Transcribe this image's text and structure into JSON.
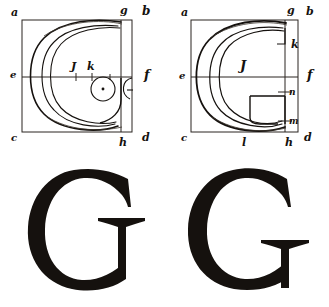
{
  "plate": {
    "title": "Geometric construction of the capital letter G",
    "background_color": "#ffffff",
    "ink_color": "#15110e",
    "construction_line_color": "#2a2520",
    "width": 329,
    "height": 307
  },
  "figures": [
    {
      "id": "construction-left",
      "caption": "Left construction of G",
      "labels": [
        {
          "key": "a",
          "text": "a",
          "x": 11,
          "y": 16
        },
        {
          "key": "g",
          "text": "g",
          "x": 120,
          "y": 14
        },
        {
          "key": "b",
          "text": "b",
          "x": 142,
          "y": 15
        },
        {
          "key": "e",
          "text": "e",
          "x": 10,
          "y": 78
        },
        {
          "key": "i",
          "text": "J",
          "x": 71,
          "y": 70
        },
        {
          "key": "k",
          "text": "k",
          "x": 87,
          "y": 70
        },
        {
          "key": "f",
          "text": "f",
          "x": 144,
          "y": 79
        },
        {
          "key": "c",
          "text": "c",
          "x": 11,
          "y": 141
        },
        {
          "key": "h",
          "text": "h",
          "x": 119,
          "y": 146
        },
        {
          "key": "d",
          "text": "d",
          "x": 142,
          "y": 141
        }
      ]
    },
    {
      "id": "construction-right",
      "caption": "Right construction of G",
      "labels": [
        {
          "key": "a",
          "text": "a",
          "x": 16,
          "y": 16
        },
        {
          "key": "g",
          "text": "g",
          "x": 122,
          "y": 14
        },
        {
          "key": "b",
          "text": "b",
          "x": 141,
          "y": 15
        },
        {
          "key": "k",
          "text": "k",
          "x": 126,
          "y": 48
        },
        {
          "key": "e",
          "text": "e",
          "x": 14,
          "y": 79
        },
        {
          "key": "i",
          "text": "J",
          "x": 75,
          "y": 70
        },
        {
          "key": "f",
          "text": "f",
          "x": 142,
          "y": 79
        },
        {
          "key": "n",
          "text": "n",
          "x": 124,
          "y": 95
        },
        {
          "key": "m",
          "text": "m",
          "x": 124,
          "y": 124
        },
        {
          "key": "c",
          "text": "c",
          "x": 16,
          "y": 141
        },
        {
          "key": "l",
          "text": "l",
          "x": 77,
          "y": 146
        },
        {
          "key": "h",
          "text": "h",
          "x": 120,
          "y": 146
        },
        {
          "key": "d",
          "text": "d",
          "x": 139,
          "y": 141
        }
      ]
    }
  ],
  "glyphs": [
    {
      "id": "glyph-left",
      "letter": "G",
      "caption": "Finished letter G, first variant"
    },
    {
      "id": "glyph-right",
      "letter": "G",
      "caption": "Finished letter G, second variant"
    }
  ]
}
